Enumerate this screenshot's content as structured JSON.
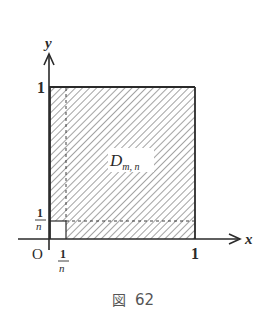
{
  "figure": {
    "caption": "図 62",
    "caption_kanji": "図",
    "caption_number": "62"
  },
  "axes": {
    "x_label": "x",
    "y_label": "y",
    "origin_label": "O",
    "x_tick_one": "1",
    "y_tick_one": "1",
    "x_tick_frac_num": "1",
    "x_tick_frac_den": "n",
    "y_tick_frac_num": "1",
    "y_tick_frac_den": "n"
  },
  "region": {
    "label_main": "D",
    "label_sub": "m, n",
    "fill": "diagonal hatching",
    "excluded": "small square [0,1/n]×[0,1/n]"
  },
  "colors": {
    "ink": "#2a2a2a",
    "hatch": "#555555",
    "background": "#ffffff"
  }
}
